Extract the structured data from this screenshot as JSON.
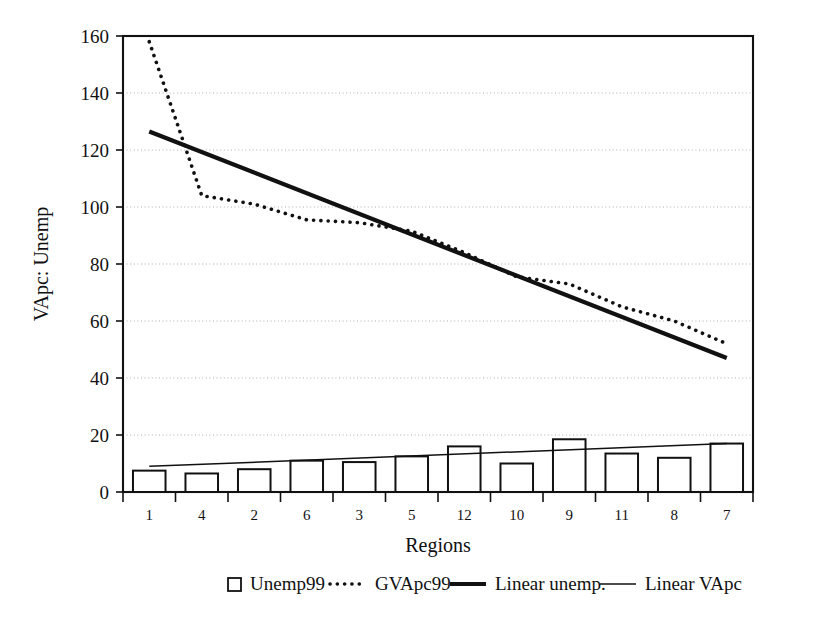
{
  "chart_data": {
    "type": "bar",
    "title": "",
    "xlabel": "Regions",
    "ylabel": "VApc: Unemp",
    "ylim": [
      0,
      160
    ],
    "ytick_step": 20,
    "yticks": [
      "0",
      "20",
      "40",
      "60",
      "80",
      "100",
      "120",
      "140",
      "160"
    ],
    "grid": true,
    "legend_position": "bottom",
    "categories": [
      "1",
      "4",
      "2",
      "6",
      "3",
      "5",
      "12",
      "10",
      "9",
      "11",
      "8",
      "7"
    ],
    "series": [
      {
        "name": "Unemp99",
        "type": "bar",
        "values": [
          7.5,
          6.5,
          8.0,
          11.0,
          10.5,
          12.5,
          16.0,
          10.0,
          18.5,
          13.5,
          12.0,
          17.0
        ]
      },
      {
        "name": "GVApc99",
        "type": "line",
        "style": "dotted",
        "values": [
          158.0,
          104.0,
          101.0,
          95.5,
          94.5,
          91.5,
          84.0,
          75.5,
          73.0,
          65.0,
          60.0,
          52.0
        ]
      },
      {
        "name": "Linear unemp.",
        "type": "trendline",
        "style": "thick",
        "endpoints": [
          126.5,
          47.0
        ]
      },
      {
        "name": "Linear VApc",
        "type": "trendline",
        "style": "thin",
        "endpoints": [
          9.0,
          17.0
        ]
      }
    ]
  },
  "axes": {
    "y_title": "VApc: Unemp",
    "x_title": "Regions"
  },
  "legend": {
    "items": [
      {
        "label": "Unemp99",
        "marker": "open-square-marker"
      },
      {
        "label": "GVApc99",
        "marker": "dotted-line-marker"
      },
      {
        "label": "Linear unemp.",
        "marker": "thick-line-marker"
      },
      {
        "label": "Linear VApc",
        "marker": "thin-line-marker"
      }
    ]
  },
  "colors": {
    "ink": "#111111",
    "grid": "#9a9a9a",
    "background": "#ffffff"
  }
}
